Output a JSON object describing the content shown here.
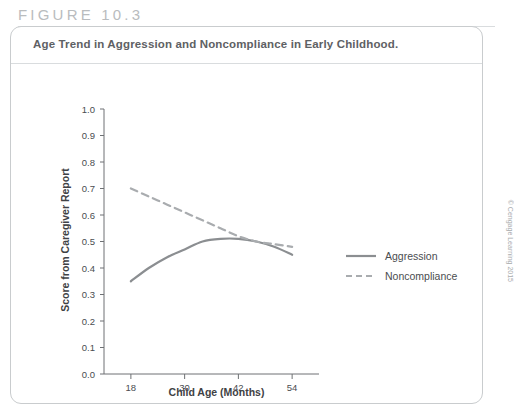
{
  "figure": {
    "number_label": "FIGURE 10.3",
    "title": "Age Trend in Aggression and Noncompliance in Early Childhood.",
    "copyright": "© Cengage Learning 2015"
  },
  "colors": {
    "aggression_line": "#8b8e91",
    "noncompliance_line": "#a9acaf",
    "axis": "#6e7174",
    "panel_border": "#c9ccce",
    "title_text": "#5e6164",
    "figure_label": "#b9bcbe"
  },
  "chart_data": {
    "type": "line",
    "title": "Age Trend in Aggression and Noncompliance in Early Childhood.",
    "xlabel": "Child Age (Months)",
    "ylabel": "Score from Caregiver Report",
    "xlim": [
      12,
      60
    ],
    "ylim": [
      0.0,
      1.0
    ],
    "xticks": [
      18,
      30,
      42,
      54
    ],
    "xtick_labels": [
      "18",
      "30",
      "42",
      "54"
    ],
    "yticks": [
      0.0,
      0.1,
      0.2,
      0.3,
      0.4,
      0.5,
      0.6,
      0.7,
      0.8,
      0.9,
      1.0
    ],
    "ytick_labels": [
      "0.0",
      "0.1",
      "0.2",
      "0.3",
      "0.4",
      "0.5",
      "0.6",
      "0.7",
      "0.8",
      "0.9",
      "1.0"
    ],
    "grid": false,
    "legend_position": "right",
    "series": [
      {
        "name": "Aggression",
        "style": "solid",
        "x": [
          18,
          22,
          26,
          30,
          34,
          38,
          42,
          46,
          50,
          54
        ],
        "values": [
          0.35,
          0.4,
          0.44,
          0.47,
          0.5,
          0.51,
          0.51,
          0.5,
          0.48,
          0.45
        ]
      },
      {
        "name": "Noncompliance",
        "style": "dashed",
        "x": [
          18,
          22,
          26,
          30,
          34,
          38,
          42,
          46,
          50,
          54
        ],
        "values": [
          0.7,
          0.67,
          0.64,
          0.61,
          0.58,
          0.55,
          0.52,
          0.5,
          0.49,
          0.48
        ]
      }
    ]
  },
  "legend": {
    "items": [
      {
        "label": "Aggression",
        "style": "solid"
      },
      {
        "label": "Noncompliance",
        "style": "dashed"
      }
    ]
  }
}
